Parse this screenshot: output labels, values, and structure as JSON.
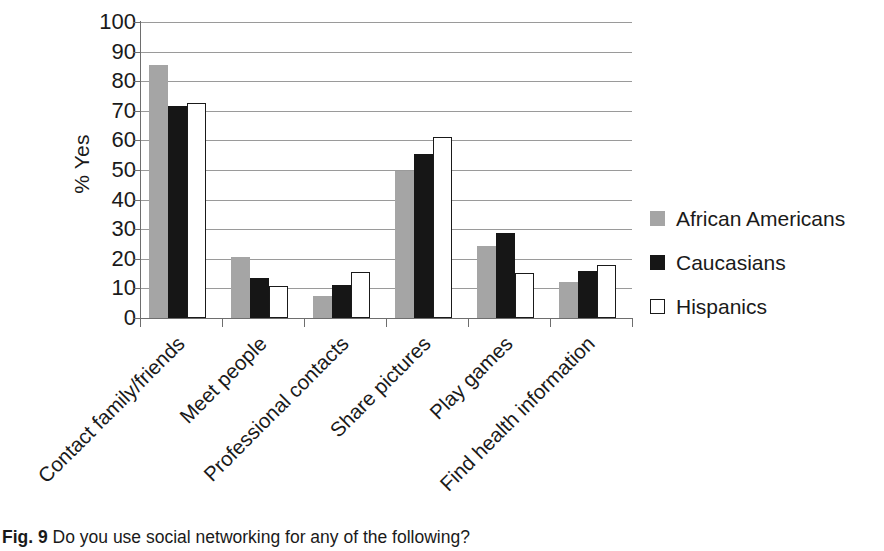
{
  "figure": {
    "caption_label": "Fig. 9",
    "caption_text": "Do you use social networking for any of the following?"
  },
  "chart_data": {
    "type": "bar",
    "title": "",
    "xlabel": "",
    "ylabel": "% Yes",
    "ylim": [
      0,
      100
    ],
    "ytick_step": 10,
    "yticks": [
      "100",
      "90",
      "80",
      "70",
      "60",
      "50",
      "40",
      "30",
      "20",
      "10",
      "0"
    ],
    "grid": true,
    "legend_position": "right",
    "categories": [
      "Contact family/friends",
      "Meet people",
      "Professional contacts",
      "Share pictures",
      "Play games",
      "Find health information"
    ],
    "series": [
      {
        "name": "African Americans",
        "color": "#a5a5a5",
        "values": [
          85.5,
          20.7,
          7.5,
          49.6,
          24.2,
          12.0
        ]
      },
      {
        "name": "Caucasians",
        "color": "#161616",
        "values": [
          71.5,
          13.4,
          11.3,
          55.4,
          28.8,
          15.8
        ]
      },
      {
        "name": "Hispanics",
        "color": "#ffffff",
        "values": [
          72.7,
          10.7,
          15.5,
          61.0,
          15.3,
          17.9
        ]
      }
    ]
  }
}
